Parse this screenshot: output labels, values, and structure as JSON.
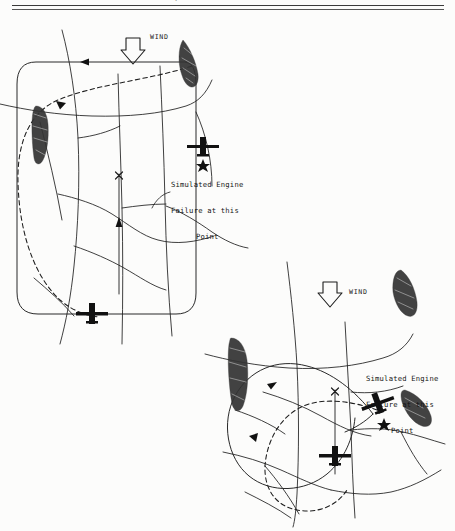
{
  "page": {
    "background_color": "#fcfcfb",
    "ink_color": "#1d1d1d",
    "clipped_heading_fragment": "g",
    "rule_count": 2
  },
  "diagrams": [
    {
      "id": "diagram-1",
      "name": "rectangular-traffic-pattern",
      "wind": {
        "label": "WIND",
        "direction": "down"
      },
      "callout": {
        "line1": "Simulated Engine",
        "line2": "Failure at this",
        "line3": "Point"
      },
      "symbols": {
        "aircraft_count": 2,
        "failure_marker": "star",
        "runway_marker": "x",
        "landmark_count": 2
      },
      "pattern_shape": "rounded-rectangle",
      "glide_path": "dashed-curve"
    },
    {
      "id": "diagram-2",
      "name": "teardrop-traffic-pattern",
      "wind": {
        "label": "WIND",
        "direction": "down"
      },
      "callout": {
        "line1": "Simulated Engine",
        "line2": "Failure at this",
        "line3": "Point"
      },
      "symbols": {
        "aircraft_count": 2,
        "failure_marker": "star",
        "runway_marker": "x",
        "landmark_count": 3
      },
      "pattern_shape": "teardrop",
      "glide_path": "dashed-curve"
    }
  ]
}
